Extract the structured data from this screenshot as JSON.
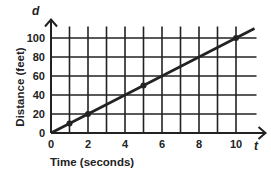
{
  "chart_data": {
    "type": "line",
    "title": "",
    "xlabel": "Time (seconds)",
    "ylabel": "Distance (feet)",
    "x_axis_variable": "t",
    "y_axis_variable": "d",
    "x_ticks": [
      "0",
      "2",
      "4",
      "6",
      "8",
      "10"
    ],
    "y_ticks": [
      "0",
      "20",
      "40",
      "60",
      "80",
      "100"
    ],
    "xlim": [
      0,
      11
    ],
    "ylim": [
      0,
      110
    ],
    "grid": true,
    "series": [
      {
        "name": "distance",
        "x": [
          0,
          1,
          2,
          5,
          10
        ],
        "values": [
          0,
          10,
          20,
          50,
          100
        ],
        "marked_points": [
          [
            1,
            10
          ],
          [
            2,
            20
          ],
          [
            5,
            50
          ],
          [
            10,
            100
          ]
        ],
        "line_extends_to": [
          11,
          110
        ]
      }
    ]
  },
  "colors": {
    "ink": "#222222",
    "background": "#ffffff"
  }
}
